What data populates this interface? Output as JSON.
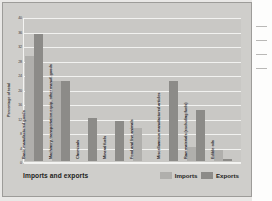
{
  "chart_data": {
    "type": "bar",
    "title": "Imports and exports",
    "xlabel": "",
    "ylabel": "Percentage of total",
    "ylim": [
      0,
      40
    ],
    "yticks": [
      0,
      4,
      8,
      12,
      16,
      20,
      24,
      28,
      32,
      36,
      40
    ],
    "grid": true,
    "legend_position": "bottom-right",
    "categories": [
      "Basic manufactured goods",
      "Machinery, transportation equip, other manuf. goods",
      "Chemicals",
      "Mineral fuels",
      "Food and live animals",
      "Miscellaneous manufactured articles",
      "Raw materials (excluding fuels)",
      "Edible oils"
    ],
    "series": [
      {
        "name": "Imports",
        "color": "#b0afac",
        "values": [
          29,
          22,
          0,
          0,
          9,
          0,
          4,
          3
        ]
      },
      {
        "name": "Exports",
        "color": "#8c8b88",
        "values": [
          35,
          22,
          12,
          11,
          0,
          22,
          14,
          0.5
        ]
      }
    ]
  },
  "legend": {
    "imports_label": "Imports",
    "exports_label": "Exports"
  },
  "colors": {
    "imports": "#b0afac",
    "exports": "#8c8b88",
    "panel": "#c9c8c5",
    "card": "#cfcecb",
    "grid": "#f2f2f0"
  }
}
